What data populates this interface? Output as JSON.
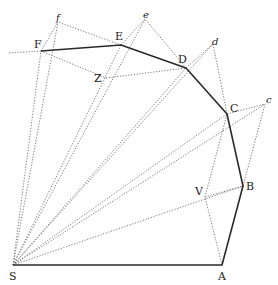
{
  "figure": {
    "points": {
      "S": {
        "label": "S",
        "x": 13,
        "y": 265,
        "lx": 9,
        "ly": 280,
        "italic": false
      },
      "A": {
        "label": "A",
        "x": 222,
        "y": 265,
        "lx": 218,
        "ly": 280,
        "italic": false
      },
      "B": {
        "label": "B",
        "x": 243,
        "y": 186,
        "lx": 246,
        "ly": 190,
        "italic": false
      },
      "V": {
        "label": "V",
        "x": 205,
        "y": 197,
        "lx": 195,
        "ly": 195,
        "italic": false
      },
      "C": {
        "label": "C",
        "x": 227,
        "y": 114,
        "lx": 230,
        "ly": 112,
        "italic": false
      },
      "c": {
        "label": "c",
        "x": 265,
        "y": 104,
        "lx": 266,
        "ly": 103,
        "italic": true
      },
      "D": {
        "label": "D",
        "x": 186,
        "y": 68,
        "lx": 178,
        "ly": 63,
        "italic": false
      },
      "d": {
        "label": "d",
        "x": 213,
        "y": 44,
        "lx": 212,
        "ly": 45,
        "italic": true
      },
      "E": {
        "label": "E",
        "x": 121,
        "y": 45,
        "lx": 115,
        "ly": 40,
        "italic": false
      },
      "e": {
        "label": "e",
        "x": 145,
        "y": 19,
        "lx": 143,
        "ly": 18,
        "italic": true
      },
      "Z": {
        "label": "Z",
        "x": 106,
        "y": 78,
        "lx": 94,
        "ly": 82,
        "italic": false
      },
      "F": {
        "label": "F",
        "x": 41,
        "y": 51,
        "lx": 34,
        "ly": 48,
        "italic": false
      },
      "f": {
        "label": "f",
        "x": 58,
        "y": 22,
        "lx": 56,
        "ly": 21,
        "italic": true
      }
    },
    "solid_path": [
      "S",
      "A",
      "B",
      "C",
      "D",
      "E",
      "F"
    ],
    "dotted_segments": [
      [
        "S",
        "B"
      ],
      [
        "S",
        "c"
      ],
      [
        "S",
        "C"
      ],
      [
        "S",
        "d"
      ],
      [
        "S",
        "D"
      ],
      [
        "S",
        "e"
      ],
      [
        "S",
        "E"
      ],
      [
        "S",
        "f"
      ],
      [
        "S",
        "F"
      ],
      [
        "A",
        "V"
      ],
      [
        "V",
        "C"
      ],
      [
        "V",
        "B"
      ],
      [
        "B",
        "c"
      ],
      [
        "C",
        "c"
      ],
      [
        "C",
        "d"
      ],
      [
        "D",
        "d"
      ],
      [
        "D",
        "e"
      ],
      [
        "E",
        "e"
      ],
      [
        "Z",
        "D"
      ],
      [
        "F",
        "Z"
      ],
      [
        "E",
        "f"
      ],
      [
        "F",
        "f"
      ],
      [
        "F",
        "W"
      ]
    ],
    "extra_points": {
      "W": {
        "x": 8,
        "y": 53
      }
    }
  }
}
